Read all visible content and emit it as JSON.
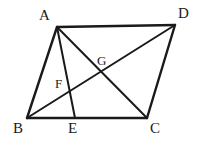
{
  "figure": {
    "background_color": "#ffffff",
    "stroke_color": "#1a1a1a",
    "label_color": "#1a1a1a",
    "width": 206,
    "height": 145,
    "points": {
      "A": {
        "label": "A",
        "x": 57,
        "y": 27,
        "label_x": 39,
        "label_y": 8
      },
      "B": {
        "label": "B",
        "x": 27,
        "y": 118,
        "label_x": 13,
        "label_y": 121
      },
      "C": {
        "label": "C",
        "x": 147,
        "y": 118,
        "label_x": 150,
        "label_y": 121
      },
      "D": {
        "label": "D",
        "x": 175,
        "y": 25,
        "label_x": 178,
        "label_y": 6
      },
      "E": {
        "label": "E",
        "x": 75,
        "y": 118,
        "label_x": 68,
        "label_y": 121
      },
      "F": {
        "label": "F",
        "x": 71,
        "y": 92,
        "label_x": 55,
        "label_y": 77
      },
      "G": {
        "label": "G",
        "x": 103,
        "y": 72,
        "label_x": 97,
        "label_y": 54
      }
    },
    "segments": [
      {
        "name": "AD",
        "from": "A",
        "to": "D",
        "width": 2.4
      },
      {
        "name": "AB",
        "from": "A",
        "to": "B",
        "width": 2.4
      },
      {
        "name": "BC",
        "from": "B",
        "to": "C",
        "width": 2.4
      },
      {
        "name": "CD",
        "from": "C",
        "to": "D",
        "width": 2.4
      },
      {
        "name": "AE",
        "from": "A",
        "to": "E",
        "width": 2.0
      },
      {
        "name": "AC",
        "from": "A",
        "to": "C",
        "width": 2.0
      },
      {
        "name": "BD",
        "from": "B",
        "to": "D",
        "width": 2.0
      }
    ]
  }
}
